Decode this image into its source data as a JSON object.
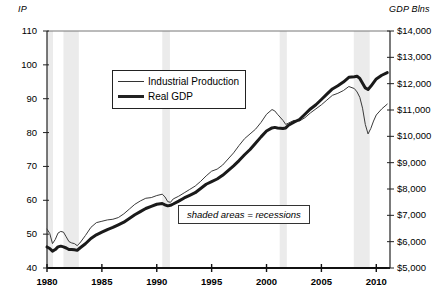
{
  "chart_data": {
    "type": "line",
    "title": "",
    "subtitle": "",
    "left_axis_label": "IP",
    "right_axis_label": "GDP Blns",
    "xlabel": "",
    "x": [
      1980,
      1985,
      1990,
      1995,
      2000,
      2005,
      2010
    ],
    "xlim": [
      1980,
      2011.25
    ],
    "xtick_labels": [
      "1980",
      "1985",
      "1990",
      "1995",
      "2000",
      "2005",
      "2010"
    ],
    "left_ylim": [
      40,
      110
    ],
    "left_ytick_labels": [
      "40",
      "50",
      "60",
      "70",
      "80",
      "90",
      "100",
      "110"
    ],
    "left_ytick_values": [
      40,
      50,
      60,
      70,
      80,
      90,
      100,
      110
    ],
    "right_ylim": [
      5000,
      14000
    ],
    "right_ytick_labels": [
      "$5,000",
      "$6,000",
      "$7,000",
      "$8,000",
      "$9,000",
      "$10,000",
      "$11,000",
      "$12,000",
      "$13,000",
      "$14,000"
    ],
    "right_ytick_values": [
      5000,
      6000,
      7000,
      8000,
      9000,
      10000,
      11000,
      12000,
      13000,
      14000
    ],
    "grid": false,
    "legend_position": "upper-left-inside",
    "annotation": "shaded areas = recessions",
    "series": [
      {
        "name": "Industrial Production",
        "axis": "left",
        "color": "#3a3a3a",
        "line_width": 1,
        "points": [
          [
            1980.0,
            51.5
          ],
          [
            1980.25,
            50.2
          ],
          [
            1980.5,
            47.2
          ],
          [
            1980.75,
            48.4
          ],
          [
            1981.0,
            50.3
          ],
          [
            1981.25,
            50.8
          ],
          [
            1981.5,
            50.6
          ],
          [
            1981.75,
            49.2
          ],
          [
            1982.0,
            47.8
          ],
          [
            1982.25,
            47.4
          ],
          [
            1982.5,
            47.2
          ],
          [
            1982.75,
            46.6
          ],
          [
            1983.0,
            47.4
          ],
          [
            1983.5,
            49.6
          ],
          [
            1984.0,
            52.0
          ],
          [
            1984.5,
            53.4
          ],
          [
            1985.0,
            53.8
          ],
          [
            1985.5,
            54.2
          ],
          [
            1986.0,
            54.4
          ],
          [
            1986.5,
            54.9
          ],
          [
            1987.0,
            56.0
          ],
          [
            1987.5,
            57.4
          ],
          [
            1988.0,
            58.8
          ],
          [
            1988.5,
            59.8
          ],
          [
            1989.0,
            60.6
          ],
          [
            1989.5,
            60.8
          ],
          [
            1990.0,
            61.4
          ],
          [
            1990.5,
            61.8
          ],
          [
            1990.75,
            61.0
          ],
          [
            1991.0,
            59.6
          ],
          [
            1991.25,
            59.4
          ],
          [
            1991.5,
            60.4
          ],
          [
            1992.0,
            61.2
          ],
          [
            1992.5,
            62.2
          ],
          [
            1993.0,
            63.2
          ],
          [
            1993.5,
            64.2
          ],
          [
            1994.0,
            65.6
          ],
          [
            1994.5,
            67.2
          ],
          [
            1995.0,
            68.6
          ],
          [
            1995.5,
            69.2
          ],
          [
            1996.0,
            70.4
          ],
          [
            1996.5,
            72.2
          ],
          [
            1997.0,
            74.0
          ],
          [
            1997.5,
            76.2
          ],
          [
            1998.0,
            78.2
          ],
          [
            1998.5,
            79.6
          ],
          [
            1999.0,
            81.0
          ],
          [
            1999.5,
            83.0
          ],
          [
            2000.0,
            85.4
          ],
          [
            2000.5,
            86.8
          ],
          [
            2000.75,
            86.4
          ],
          [
            2001.0,
            85.4
          ],
          [
            2001.5,
            83.6
          ],
          [
            2001.75,
            82.4
          ],
          [
            2002.0,
            82.8
          ],
          [
            2002.5,
            83.6
          ],
          [
            2003.0,
            83.4
          ],
          [
            2003.5,
            84.4
          ],
          [
            2004.0,
            85.8
          ],
          [
            2004.5,
            87.0
          ],
          [
            2005.0,
            88.2
          ],
          [
            2005.5,
            89.6
          ],
          [
            2006.0,
            91.0
          ],
          [
            2006.5,
            91.6
          ],
          [
            2007.0,
            92.4
          ],
          [
            2007.5,
            93.6
          ],
          [
            2008.0,
            93.0
          ],
          [
            2008.25,
            92.0
          ],
          [
            2008.5,
            90.4
          ],
          [
            2008.75,
            87.2
          ],
          [
            2009.0,
            82.4
          ],
          [
            2009.25,
            79.6
          ],
          [
            2009.5,
            81.2
          ],
          [
            2009.75,
            83.4
          ],
          [
            2010.0,
            85.2
          ],
          [
            2010.5,
            87.0
          ],
          [
            2011.0,
            88.4
          ]
        ]
      },
      {
        "name": "Real GDP",
        "axis": "right",
        "color": "#1a1a1a",
        "line_width": 3,
        "points": [
          [
            1980.0,
            5800
          ],
          [
            1980.25,
            5740
          ],
          [
            1980.5,
            5640
          ],
          [
            1980.75,
            5700
          ],
          [
            1981.0,
            5800
          ],
          [
            1981.25,
            5830
          ],
          [
            1981.5,
            5800
          ],
          [
            1981.75,
            5760
          ],
          [
            1982.0,
            5700
          ],
          [
            1982.25,
            5700
          ],
          [
            1982.5,
            5690
          ],
          [
            1982.75,
            5670
          ],
          [
            1983.0,
            5760
          ],
          [
            1983.5,
            5920
          ],
          [
            1984.0,
            6120
          ],
          [
            1984.5,
            6260
          ],
          [
            1985.0,
            6360
          ],
          [
            1985.5,
            6460
          ],
          [
            1986.0,
            6540
          ],
          [
            1986.5,
            6640
          ],
          [
            1987.0,
            6740
          ],
          [
            1987.5,
            6880
          ],
          [
            1988.0,
            7020
          ],
          [
            1988.5,
            7140
          ],
          [
            1989.0,
            7260
          ],
          [
            1989.5,
            7340
          ],
          [
            1990.0,
            7420
          ],
          [
            1990.5,
            7450
          ],
          [
            1990.75,
            7400
          ],
          [
            1991.0,
            7360
          ],
          [
            1991.25,
            7380
          ],
          [
            1991.5,
            7430
          ],
          [
            1992.0,
            7540
          ],
          [
            1992.5,
            7660
          ],
          [
            1993.0,
            7760
          ],
          [
            1993.5,
            7860
          ],
          [
            1994.0,
            8020
          ],
          [
            1994.5,
            8180
          ],
          [
            1995.0,
            8280
          ],
          [
            1995.5,
            8380
          ],
          [
            1996.0,
            8520
          ],
          [
            1996.5,
            8700
          ],
          [
            1997.0,
            8880
          ],
          [
            1997.5,
            9080
          ],
          [
            1998.0,
            9300
          ],
          [
            1998.5,
            9500
          ],
          [
            1999.0,
            9740
          ],
          [
            1999.5,
            9980
          ],
          [
            2000.0,
            10200
          ],
          [
            2000.5,
            10320
          ],
          [
            2000.75,
            10340
          ],
          [
            2001.0,
            10320
          ],
          [
            2001.5,
            10300
          ],
          [
            2001.75,
            10320
          ],
          [
            2002.0,
            10420
          ],
          [
            2002.5,
            10540
          ],
          [
            2003.0,
            10640
          ],
          [
            2003.5,
            10840
          ],
          [
            2004.0,
            11040
          ],
          [
            2004.5,
            11200
          ],
          [
            2005.0,
            11400
          ],
          [
            2005.5,
            11600
          ],
          [
            2006.0,
            11800
          ],
          [
            2006.5,
            11920
          ],
          [
            2007.0,
            12060
          ],
          [
            2007.5,
            12240
          ],
          [
            2008.0,
            12260
          ],
          [
            2008.25,
            12280
          ],
          [
            2008.5,
            12200
          ],
          [
            2008.75,
            12020
          ],
          [
            2009.0,
            11840
          ],
          [
            2009.25,
            11780
          ],
          [
            2009.5,
            11900
          ],
          [
            2009.75,
            12040
          ],
          [
            2010.0,
            12180
          ],
          [
            2010.5,
            12320
          ],
          [
            2011.0,
            12420
          ]
        ]
      }
    ],
    "shaded_regions": [
      {
        "label": "1980 recession",
        "start": 1980.0,
        "end": 1980.55
      },
      {
        "label": "1981-82 recession",
        "start": 1981.5,
        "end": 1982.9
      },
      {
        "label": "1990-91 recession",
        "start": 1990.5,
        "end": 1991.2
      },
      {
        "label": "2001 recession",
        "start": 2001.2,
        "end": 2001.85
      },
      {
        "label": "2008-09 recession",
        "start": 2007.95,
        "end": 2009.4
      }
    ],
    "shade_color": "#ebebeb"
  },
  "legend": {
    "items": [
      {
        "label": "Industrial Production",
        "style": "thin"
      },
      {
        "label": "Real GDP",
        "style": "thick"
      }
    ]
  },
  "annotation": {
    "text": "shaded areas = recessions"
  }
}
